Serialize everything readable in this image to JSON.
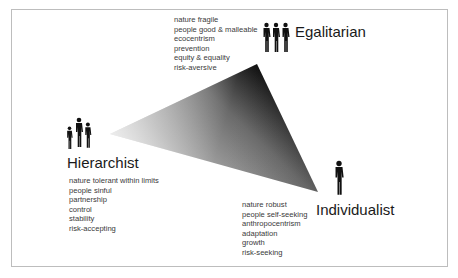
{
  "diagram": {
    "type": "cultural-theory-triangle",
    "nodes": {
      "egalitarian": {
        "label": "Egalitarian",
        "icon": "three-equal-people-icon",
        "traits": [
          "nature fragile",
          "people good & malleable",
          "ecocentrism",
          "prevention",
          "equity & equality",
          "risk-aversive"
        ]
      },
      "hierarchist": {
        "label": "Hierarchist",
        "icon": "family-group-icon",
        "traits": [
          "nature tolerant within limits",
          "people sinful",
          "partnership",
          "control",
          "stability",
          "risk-accepting"
        ]
      },
      "individualist": {
        "label": "Individualist",
        "icon": "single-person-icon",
        "traits": [
          "nature robust",
          "people self-seeking",
          "anthropocentrism",
          "adaptation",
          "growth",
          "risk-seeking"
        ]
      }
    },
    "colors": {
      "border": "#bdbdbd",
      "triangle_dark": "#111111",
      "triangle_light": "#d8d8d8",
      "text": "#3a3a3a"
    }
  }
}
